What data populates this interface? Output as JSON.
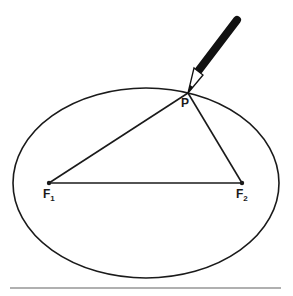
{
  "diagram": {
    "labels": {
      "point": "P",
      "focus1": "F",
      "focus1_sub": "1",
      "focus2": "F",
      "focus2_sub": "2"
    },
    "elements": [
      "ellipse",
      "focus F1",
      "focus F2",
      "point P",
      "pencil",
      "string triangle F1-P-F2"
    ],
    "colors": {
      "stroke": "#1a1a1a",
      "divider": "#b0b0b0",
      "background": "#ffffff"
    }
  }
}
